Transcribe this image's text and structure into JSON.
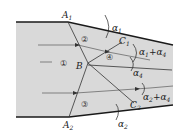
{
  "diagram": {
    "title": "",
    "colors": {
      "background": "#ffffff",
      "flow_region": "#d9d9d9",
      "lines": "#1a1a1a"
    },
    "points": {
      "A1": {
        "label": "A",
        "sub": "1"
      },
      "A2": {
        "label": "A",
        "sub": "2"
      },
      "B": {
        "label": "B"
      },
      "C1": {
        "label": "C",
        "sub": "1"
      },
      "C2": {
        "label": "C",
        "sub": "2"
      }
    },
    "regions": [
      "①",
      "②",
      "③",
      "④"
    ],
    "angles": {
      "alpha1": {
        "label": "α",
        "sub": "1"
      },
      "alpha2": {
        "label": "α",
        "sub": "2"
      },
      "alpha4": {
        "label": "α",
        "sub": "4"
      },
      "alpha1_plus_alpha4": {
        "label": "α",
        "sub": "1",
        "plus": "+α",
        "sub2": "4"
      },
      "alpha2_plus_alpha4": {
        "label": "α",
        "sub": "2",
        "plus": "+α",
        "sub2": "4"
      }
    }
  }
}
